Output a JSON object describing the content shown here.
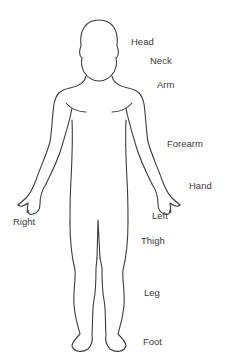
{
  "diagram": {
    "type": "human-body-outline-front",
    "stroke_color": "#3c3c3c",
    "labels": [
      {
        "id": "head",
        "text": "Head",
        "x": 131,
        "y": 41
      },
      {
        "id": "neck",
        "text": "Neck",
        "x": 150,
        "y": 60
      },
      {
        "id": "arm",
        "text": "Arm",
        "x": 157,
        "y": 84
      },
      {
        "id": "forearm",
        "text": "Forearm",
        "x": 167,
        "y": 143
      },
      {
        "id": "hand",
        "text": "Hand",
        "x": 189,
        "y": 185
      },
      {
        "id": "right",
        "text": "Right",
        "x": 13,
        "y": 221
      },
      {
        "id": "left",
        "text": "Left",
        "x": 152,
        "y": 215
      },
      {
        "id": "thigh",
        "text": "Thigh",
        "x": 141,
        "y": 240
      },
      {
        "id": "leg",
        "text": "Leg",
        "x": 144,
        "y": 292
      },
      {
        "id": "foot",
        "text": "Foot",
        "x": 143,
        "y": 341
      }
    ]
  }
}
